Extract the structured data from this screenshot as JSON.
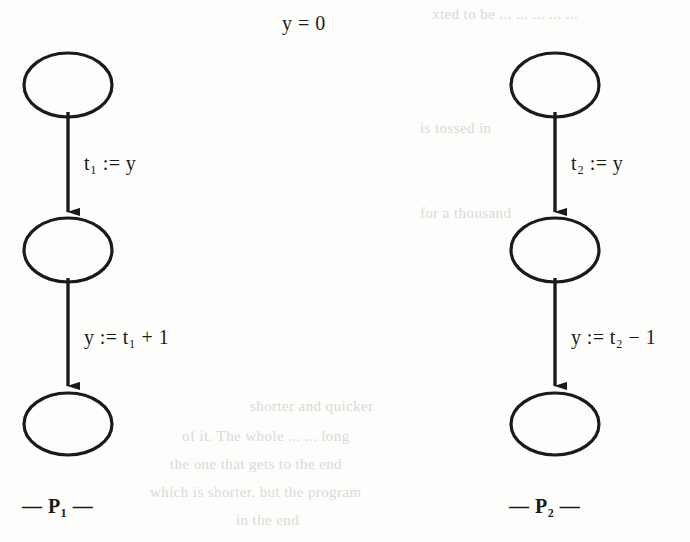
{
  "figure": {
    "type": "flowchart-diagram",
    "title": "y = 0",
    "ink_color": "#1a1a1a",
    "background_color": "#fdfdfc",
    "processes": [
      {
        "id": "P1",
        "label": "— P₁ —",
        "name_plain": "P1",
        "nodes": [
          {
            "id": "p1-n1",
            "cx": 68,
            "cy": 85,
            "rx": 44,
            "ry": 32,
            "fill": "none"
          },
          {
            "id": "p1-n2",
            "cx": 68,
            "cy": 250,
            "rx": 44,
            "ry": 32,
            "fill": "none"
          },
          {
            "id": "p1-n3",
            "cx": 68,
            "cy": 424,
            "rx": 44,
            "ry": 32,
            "fill": "none"
          }
        ],
        "edges": [
          {
            "id": "p1-e1",
            "from": "p1-n1",
            "to": "p1-n2",
            "label": "t₁ := y",
            "label_x": 84,
            "label_y": 152
          },
          {
            "id": "p1-e2",
            "from": "p1-n2",
            "to": "p1-n3",
            "label": "y := t₁ + 1",
            "label_x": 84,
            "label_y": 326
          }
        ]
      },
      {
        "id": "P2",
        "label": "— P₂ —",
        "name_plain": "P2",
        "nodes": [
          {
            "id": "p2-n1",
            "cx": 555,
            "cy": 85,
            "rx": 44,
            "ry": 32,
            "fill": "none"
          },
          {
            "id": "p2-n2",
            "cx": 555,
            "cy": 250,
            "rx": 44,
            "ry": 32,
            "fill": "none"
          },
          {
            "id": "p2-n3",
            "cx": 555,
            "cy": 424,
            "rx": 44,
            "ry": 32,
            "fill": "none"
          }
        ],
        "edges": [
          {
            "id": "p2-e1",
            "from": "p2-n1",
            "to": "p2-n2",
            "label": "t₂ := y",
            "label_x": 571,
            "label_y": 152
          },
          {
            "id": "p2-e2",
            "from": "p2-n2",
            "to": "p2-n3",
            "label": "y := t₂ − 1",
            "label_x": 571,
            "label_y": 326
          }
        ]
      }
    ],
    "labels": {
      "title": "y = 0",
      "p1_edge1": "t₁ := y",
      "p1_edge2": "y := t₁ + 1",
      "p2_edge1": "t₂ := y",
      "p2_edge2": "y := t₂ − 1",
      "p1_caption": "— P₁ —",
      "p2_caption": "— P₂ —"
    },
    "background_ghost_text": [
      {
        "text": "xted to be ... ... ... ... ...",
        "x": 432,
        "y": 6,
        "size": 15
      },
      {
        "text": "is  tossed  in",
        "x": 420,
        "y": 120,
        "size": 15
      },
      {
        "text": "for a thousand",
        "x": 420,
        "y": 205,
        "size": 15
      },
      {
        "text": "shorter  and  quicker",
        "x": 250,
        "y": 398,
        "size": 15
      },
      {
        "text": "of  it.  The  whole  ... ...  long",
        "x": 182,
        "y": 428,
        "size": 15
      },
      {
        "text": "the  one  that  gets  to  the  end",
        "x": 170,
        "y": 456,
        "size": 15
      },
      {
        "text": "which is shorter.   but  the  program",
        "x": 150,
        "y": 484,
        "size": 15
      },
      {
        "text": "in  the  end",
        "x": 236,
        "y": 512,
        "size": 15
      }
    ]
  }
}
